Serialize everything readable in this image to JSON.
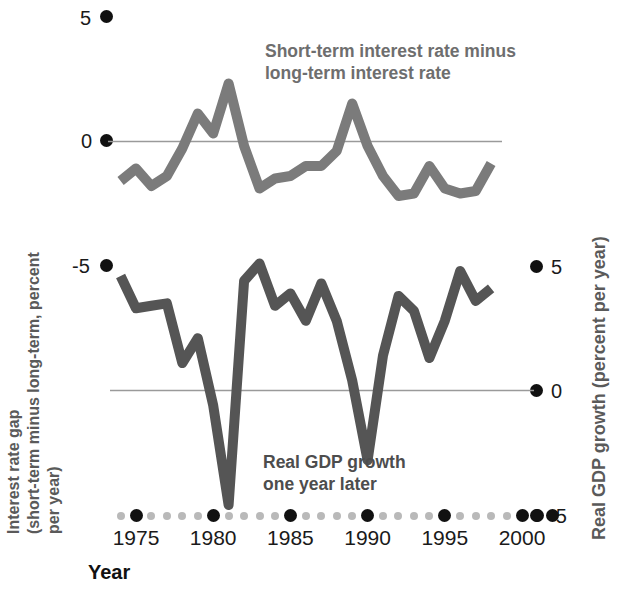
{
  "figure": {
    "background": "#ffffff",
    "width": 619,
    "height": 593
  },
  "labels": {
    "x_axis_title": "Year",
    "y_left_title": "Interest rate gap\n(short-term minus long-term, percent per year)",
    "y_right_title": "Real GDP growth (percent per year)",
    "top_series_title": "Short-term interest rate minus\nlong-term interest rate",
    "bottom_series_title": "Real GDP growth\none year later"
  },
  "colors": {
    "top_line": "#7b7b7b",
    "bottom_line": "#555555",
    "gridline": "#9a9a9a",
    "tick_major": "#111111",
    "tick_minor": "#b9b9b9",
    "title_gray": "#6e6e6e",
    "axis_text": "#1a1a1a"
  },
  "axes": {
    "left_ticks": [
      "5",
      "0",
      "-5"
    ],
    "right_ticks": [
      "5",
      "0",
      "-5"
    ],
    "x_ticks": [
      "1975",
      "1980",
      "1985",
      "1990",
      "1995",
      "2000"
    ],
    "left_ylim": [
      -5,
      5
    ],
    "right_ylim": [
      -5,
      5
    ],
    "xlim": [
      1973,
      2002
    ],
    "grid": "zero-line-only"
  },
  "chart_data": {
    "type": "line",
    "xlabel": "Year",
    "ylabel": "Interest rate gap (short-term minus long-term, percent per year)",
    "ylabel_right": "Real GDP growth (percent per year)",
    "xlim": [
      1973,
      2002
    ],
    "ylim": [
      -5,
      5
    ],
    "ylim_right": [
      -5,
      5
    ],
    "grid": false,
    "legend": "inline-annotations",
    "x": [
      1974,
      1975,
      1976,
      1977,
      1978,
      1979,
      1980,
      1981,
      1982,
      1983,
      1984,
      1985,
      1986,
      1987,
      1988,
      1989,
      1990,
      1991,
      1992,
      1993,
      1994,
      1995,
      1996,
      1997,
      1998
    ],
    "series": [
      {
        "name": "Short-term interest rate minus long-term interest rate",
        "axis": "left",
        "color": "#7b7b7b",
        "values": [
          -1.6,
          -1.1,
          -1.8,
          -1.4,
          -0.3,
          1.1,
          0.3,
          2.3,
          -0.2,
          -1.9,
          -1.5,
          -1.4,
          -1.0,
          -1.0,
          -0.4,
          1.5,
          -0.2,
          -1.4,
          -2.2,
          -2.1,
          -1.0,
          -1.9,
          -2.1,
          -2.0,
          -0.9
        ]
      },
      {
        "name": "Real GDP growth one year later",
        "axis": "right",
        "color": "#555555",
        "values": [
          4.6,
          3.3,
          3.4,
          3.5,
          1.1,
          2.1,
          -0.6,
          -4.6,
          4.4,
          5.1,
          3.4,
          3.9,
          2.8,
          4.3,
          2.8,
          0.4,
          -2.8,
          1.4,
          3.8,
          3.2,
          1.3,
          2.8,
          4.8,
          3.6,
          4.1
        ]
      }
    ],
    "annotations": [
      {
        "text": "Short-term interest rate minus\nlong-term interest rate",
        "target": "top-series"
      },
      {
        "text": "Real GDP growth\none year later",
        "target": "bottom-series"
      }
    ]
  }
}
